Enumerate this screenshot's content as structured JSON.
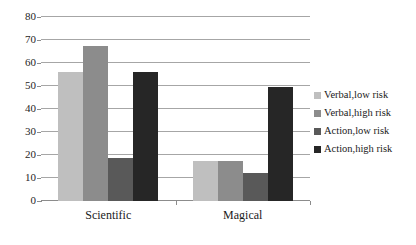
{
  "chart_data": {
    "type": "bar",
    "title": "",
    "subtitle": "",
    "xlabel": "",
    "ylabel": "",
    "categories": [
      "Scientific",
      "Magical"
    ],
    "series": [
      {
        "name": "Verbal,low risk",
        "color": "#bfbfbf",
        "values": [
          56,
          17.5
        ]
      },
      {
        "name": "Verbal,high risk",
        "color": "#8c8c8c",
        "values": [
          67.5,
          17.5
        ]
      },
      {
        "name": "Action,low risk",
        "color": "#595959",
        "values": [
          18.5,
          12
        ]
      },
      {
        "name": "Action,high risk",
        "color": "#262626",
        "values": [
          56,
          49.5
        ]
      }
    ],
    "ylim": [
      0,
      80
    ],
    "ytick_values": [
      0,
      10,
      20,
      30,
      40,
      50,
      60,
      70,
      80
    ],
    "ytick_labels": [
      "0",
      "10",
      "20",
      "30",
      "40",
      "50",
      "60",
      "70",
      "80"
    ],
    "grid": true,
    "grid_axis": "y",
    "legend_position": "right",
    "gridline_color": "#a6a6a6",
    "axis_color": "#8c8c8c",
    "background_color": "#ffffff"
  },
  "legend": {
    "items": [
      {
        "label": "Verbal,low risk",
        "swatch_name": "legend-swatch-verbal-low-risk"
      },
      {
        "label": "Verbal,high risk",
        "swatch_name": "legend-swatch-verbal-high-risk"
      },
      {
        "label": "Action,low risk",
        "swatch_name": "legend-swatch-action-low-risk"
      },
      {
        "label": "Action,high risk",
        "swatch_name": "legend-swatch-action-high-risk"
      }
    ]
  }
}
